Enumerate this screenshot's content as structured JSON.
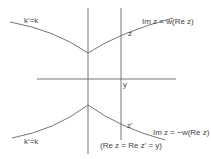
{
  "diagram": {
    "labels": {
      "upper_left": "k'=k",
      "lower_left": "k'=k",
      "z_upper": "z",
      "z_lower": "z'",
      "y_axis_mark": "y",
      "upper_curve": "Im z = w(Re z)",
      "lower_curve": "Im z = −w(Re z)",
      "vertical_line": "(Re z = Re z' = y)"
    },
    "colors": {
      "line": "#666666",
      "text": "#444444",
      "background": "#ffffff"
    }
  }
}
